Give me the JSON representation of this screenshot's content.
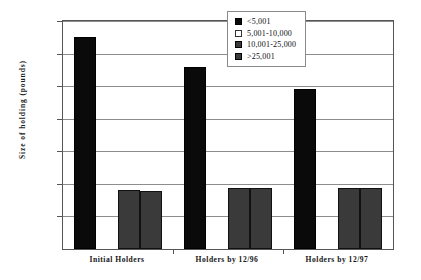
{
  "chart_data": {
    "type": "bar",
    "title": "",
    "xlabel": "",
    "ylabel": "Size  of  holding  (pounds)",
    "ylim": [
      0,
      1400
    ],
    "ytick_step": 200,
    "yticks": [
      "1,400",
      "1,200",
      "1,000",
      "800",
      "600",
      "400",
      "200"
    ],
    "ytick_values": [
      1400,
      1200,
      1000,
      800,
      600,
      400,
      200
    ],
    "grid": true,
    "legend_position": "top-right",
    "categories": [
      "Initial Holders",
      "Holders by 12/96",
      "Holders by 12/97"
    ],
    "series": [
      {
        "name": "<5,001",
        "color": "#0a0a0a",
        "values": [
          1300,
          1120,
          980
        ]
      },
      {
        "name": "5,001-10,000",
        "color": "#ffffff",
        "values": [
          0,
          0,
          0
        ]
      },
      {
        "name": "10,001-25,000",
        "color": "#3a3a3a",
        "values": [
          360,
          375,
          375
        ]
      },
      {
        "name": ">25,001",
        "color": "#3a3a3a",
        "values": [
          355,
          375,
          375
        ]
      }
    ]
  }
}
